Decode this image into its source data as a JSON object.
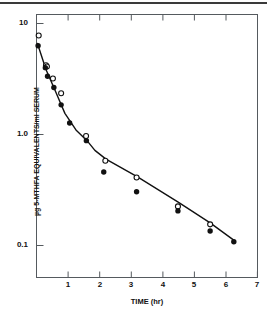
{
  "figure": {
    "name": "pharmacokinetic-decay-plot",
    "background_color": "#ffffff",
    "foreground_color": "#111111"
  },
  "axes": {
    "x": {
      "label": "TIME (hr)",
      "ticks": [
        "1",
        "2",
        "3",
        "4",
        "5",
        "6",
        "7"
      ],
      "tick_values": [
        1,
        2,
        3,
        4,
        5,
        6,
        7
      ],
      "range": [
        0,
        7
      ],
      "scale": "linear"
    },
    "y": {
      "label": "µg 5-MTHFA EQUIVALENTS/ml SERUM",
      "ticks": [
        "10",
        "1.0",
        "0.1"
      ],
      "tick_values": [
        10,
        1.0,
        0.1
      ],
      "range": [
        0.06,
        13
      ],
      "scale": "log"
    }
  },
  "chart_data": {
    "type": "scatter",
    "title": "",
    "subtitle": "",
    "xlabel": "TIME (hr)",
    "ylabel": "µg 5-MTHFA EQUIVALENTS/ml SERUM",
    "xlim": [
      0,
      7
    ],
    "ylim": [
      0.06,
      13
    ],
    "yscale": "log",
    "xscale": "linear",
    "grid": false,
    "legend": "none",
    "series": [
      {
        "name": "open-circles",
        "marker": "open-circle",
        "color": "#111111",
        "points": [
          {
            "x": 0.07,
            "y": 7.8
          },
          {
            "x": 0.3,
            "y": 4.2
          },
          {
            "x": 0.33,
            "y": 4.1
          },
          {
            "x": 0.52,
            "y": 3.2
          },
          {
            "x": 0.78,
            "y": 2.35
          },
          {
            "x": 1.57,
            "y": 0.97
          },
          {
            "x": 2.18,
            "y": 0.58
          },
          {
            "x": 3.17,
            "y": 0.41
          },
          {
            "x": 4.48,
            "y": 0.225
          },
          {
            "x": 5.5,
            "y": 0.155
          }
        ]
      },
      {
        "name": "filled-circles",
        "marker": "filled-circle",
        "color": "#111111",
        "points": [
          {
            "x": 0.05,
            "y": 6.3
          },
          {
            "x": 0.28,
            "y": 4.0
          },
          {
            "x": 0.35,
            "y": 3.35
          },
          {
            "x": 0.55,
            "y": 2.65
          },
          {
            "x": 0.78,
            "y": 1.85
          },
          {
            "x": 1.05,
            "y": 1.27
          },
          {
            "x": 1.58,
            "y": 0.88
          },
          {
            "x": 2.13,
            "y": 0.46
          },
          {
            "x": 3.17,
            "y": 0.305
          },
          {
            "x": 4.48,
            "y": 0.205
          },
          {
            "x": 5.5,
            "y": 0.135
          },
          {
            "x": 6.25,
            "y": 0.108
          }
        ]
      }
    ],
    "fit_line": {
      "name": "biexponential-fit",
      "color": "#111111",
      "points": [
        {
          "x": 0.03,
          "y": 6.6
        },
        {
          "x": 0.3,
          "y": 3.85
        },
        {
          "x": 0.6,
          "y": 2.45
        },
        {
          "x": 0.9,
          "y": 1.55
        },
        {
          "x": 1.25,
          "y": 1.1
        },
        {
          "x": 1.6,
          "y": 0.88
        },
        {
          "x": 1.85,
          "y": 0.72
        },
        {
          "x": 2.2,
          "y": 0.6
        },
        {
          "x": 3.2,
          "y": 0.415
        },
        {
          "x": 4.5,
          "y": 0.245
        },
        {
          "x": 5.5,
          "y": 0.16
        },
        {
          "x": 6.28,
          "y": 0.11
        }
      ]
    }
  }
}
